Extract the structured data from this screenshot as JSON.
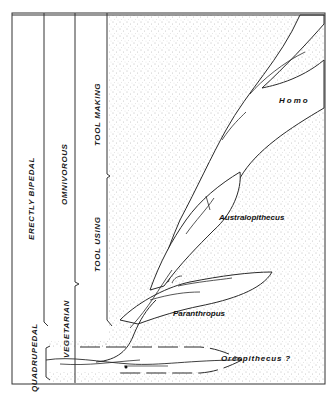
{
  "diagram": {
    "type": "phylogenetic-adaptive-zones",
    "columns": [
      {
        "id": "locomotion",
        "labels": {
          "lower": "QUADRUPEDAL",
          "upper": "ERECTLY BIPEDAL"
        }
      },
      {
        "id": "diet",
        "labels": {
          "lower": "VEGETARIAN",
          "upper": "OMNIVOROUS"
        }
      },
      {
        "id": "tools",
        "labels": {
          "lower": "TOOL USING",
          "upper": "TOOL MAKING"
        }
      }
    ],
    "taxa": [
      {
        "name": "Homo"
      },
      {
        "name": "Australopithecus"
      },
      {
        "name": "Paranthropus"
      },
      {
        "name": "Oreopithecus ?"
      }
    ],
    "colors": {
      "line": "#2a2a2a",
      "stipple": "#8a8a8a",
      "background": "#ffffff"
    }
  }
}
